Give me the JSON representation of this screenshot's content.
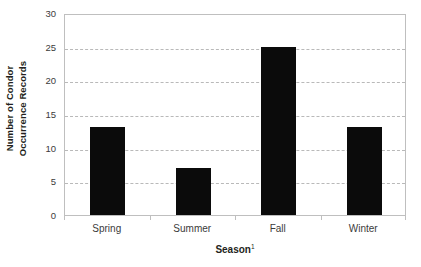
{
  "chart_data": {
    "type": "bar",
    "title": "",
    "subtitle": "",
    "categories": [
      "Spring",
      "Summer",
      "Fall",
      "Winter"
    ],
    "values": [
      13,
      7,
      25,
      13
    ],
    "series": [
      {
        "name": "Number of Condor Occurrence Records",
        "values": [
          13,
          7,
          25,
          13
        ]
      }
    ],
    "xlabel": "Season",
    "xlabel_superscript": "1",
    "ylabel_line1": "Number of Condor",
    "ylabel_line2": "Occurrence Records",
    "ylabel": "Number of Condor Occurrence Records",
    "ylim": [
      0,
      30
    ],
    "ytick_values": [
      0,
      5,
      10,
      15,
      20,
      25,
      30
    ],
    "ytick_labels": [
      "0",
      "5",
      "10",
      "15",
      "20",
      "25",
      "30"
    ],
    "gridlines": "horizontal-dashed",
    "grid_values": [
      5,
      10,
      15,
      20,
      25
    ],
    "legend": "none",
    "legend_position": "none",
    "bar_color": "#0b0b0b",
    "grid_color": "#b9b9b9",
    "axis_color": "#bfbfbf",
    "background_color": "#ffffff",
    "text_color": "#231f20",
    "tick_text_color": "#3b3b3b"
  }
}
